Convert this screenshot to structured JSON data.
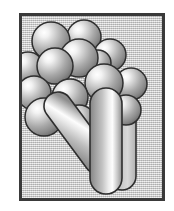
{
  "figure": {
    "frame": {
      "border_color": "#3a3a3a",
      "border_width": 3,
      "background_color": "#c9c9c9",
      "background_pattern": "dithered-halftone-gray",
      "x": 19,
      "y": 13,
      "width": 146,
      "height": 188
    },
    "canvas": {
      "width": 174,
      "height": 211,
      "background_color": "#ffffff"
    },
    "palette": {
      "outline": "#2e2e2e",
      "highlight": "#ffffff",
      "midtone": "#b4b4b4",
      "shadow": "#6e6e6e",
      "deep_shadow": "#4a4a4a"
    },
    "light_source": "upper-left",
    "spheres": [
      {
        "id": "sphere-1",
        "cx": 51,
        "cy": 41,
        "r": 19
      },
      {
        "id": "sphere-2",
        "cx": 84,
        "cy": 37,
        "r": 17
      },
      {
        "id": "sphere-3",
        "cx": 79,
        "cy": 58,
        "r": 19
      },
      {
        "id": "sphere-4",
        "cx": 110,
        "cy": 55,
        "r": 16
      },
      {
        "id": "sphere-5",
        "cx": 55,
        "cy": 66,
        "r": 18
      },
      {
        "id": "sphere-6",
        "cx": 28,
        "cy": 68,
        "r": 16
      },
      {
        "id": "sphere-7",
        "cx": 104,
        "cy": 83,
        "r": 19
      },
      {
        "id": "sphere-8",
        "cx": 131,
        "cy": 84,
        "r": 16
      },
      {
        "id": "sphere-9",
        "cx": 34,
        "cy": 93,
        "r": 17
      },
      {
        "id": "sphere-10",
        "cx": 70,
        "cy": 97,
        "r": 18
      },
      {
        "id": "sphere-11",
        "cx": 44,
        "cy": 117,
        "r": 19
      },
      {
        "id": "sphere-12",
        "cx": 79,
        "cy": 122,
        "r": 17
      },
      {
        "id": "sphere-13",
        "cx": 126,
        "cy": 110,
        "r": 15
      },
      {
        "id": "sphere-14",
        "cx": 98,
        "cy": 63,
        "r": 13
      }
    ],
    "cylinders": [
      {
        "id": "cylinder-back",
        "shape": "capsule",
        "orientation": "vertical",
        "x1": 122,
        "y1": 110,
        "x2": 122,
        "y2": 176,
        "radius": 14,
        "fill": "light-gray",
        "layer": "back"
      },
      {
        "id": "cylinder-diagonal",
        "shape": "capsule",
        "orientation": "diagonal",
        "x1": 98,
        "y1": 106,
        "x2": 58,
        "y2": 160,
        "radius": 14,
        "fill": "highlight-stripe",
        "layer": "middle"
      },
      {
        "id": "cylinder-main",
        "shape": "capsule",
        "orientation": "vertical",
        "x1": 106,
        "y1": 104,
        "x2": 106,
        "y2": 178,
        "radius": 16,
        "fill": "highlight-stripe",
        "layer": "front"
      }
    ]
  }
}
